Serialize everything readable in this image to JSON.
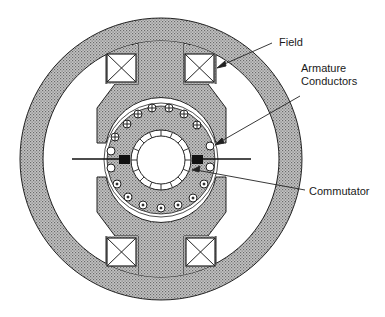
{
  "figure": {
    "labels": {
      "field": "Field",
      "armature_line1": "Armature",
      "armature_line2": "Conductors",
      "commutator": "Commutator"
    },
    "colors": {
      "stipple_fill": "#a9a9a9",
      "outline": "#222222",
      "background": "#ffffff"
    },
    "conductors": {
      "top_symbol": "cross (current into page)",
      "bottom_symbol": "dot (current out of page)",
      "side_symbol": "empty (commutating)",
      "top_count": 7,
      "bottom_count": 7,
      "side_count": 4
    },
    "commutator_segments": 16
  }
}
